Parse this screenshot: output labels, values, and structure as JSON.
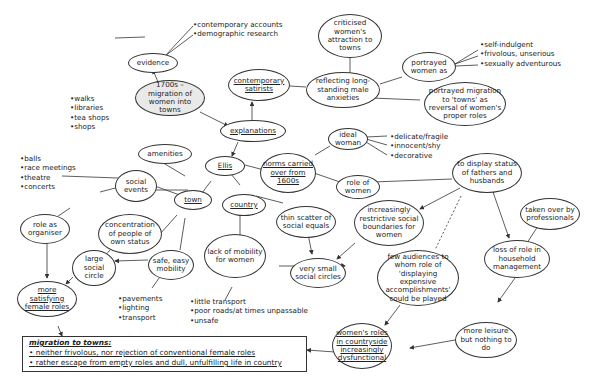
{
  "diagram": {
    "central": "1700s – migration of women into towns",
    "nodes": {
      "evidence": "evidence",
      "explanations": "explanations",
      "contemporary_satirists": "contemporary satirists",
      "criticised": "criticised women's attraction to towns",
      "reflecting": "reflecting long-standing male anxieties",
      "portrayed_women": "portrayed women as",
      "portrayed_migration": "portrayed migration to 'towns' as reversal of women's proper roles",
      "ellis": "Ellis",
      "norms": "norms carried over from 1600s",
      "ideal_woman": "ideal woman",
      "role_of_women": "role of women",
      "display_status": "to display status of fathers and husbands",
      "taken_over": "taken over by professionals",
      "loss_of_role": "loss of role in household management",
      "more_leisure": "more leisure but nothing to do",
      "restrictive": "increasingly restrictive social boundaries for women",
      "few_audiences": "few audiences to whom role of 'displaying expensive accomplishments' could be played",
      "womens_roles_country": "women's roles in countryside increasingly dysfunctional",
      "country": "country",
      "thin_scatter": "thin scatter of social equals",
      "lack_mobility": "lack of mobility for women",
      "very_small": "very small social circles",
      "town": "town",
      "amenities": "amenities",
      "social_events": "social events",
      "role_organiser": "role as organiser",
      "concentration": "concentration of people of own status",
      "large_circle": "large social circle",
      "safe_mobility": "safe, easy mobility",
      "more_satisfying": "more satisfying female roles"
    },
    "lists": {
      "evidence": [
        "contemporary accounts",
        "demographic research"
      ],
      "portrayed_women": [
        "self-indulgent",
        "frivolous, unserious",
        "sexually adventurous"
      ],
      "ideal_woman": [
        "delicate/fragile",
        "innocent/shy",
        "decorative"
      ],
      "amenities": [
        "walks",
        "libraries",
        "tea shops",
        "shops"
      ],
      "social_events": [
        "balls",
        "race meetings",
        "theatre",
        "concerts"
      ],
      "safe_mobility": [
        "pavements",
        "lighting",
        "transport"
      ],
      "lack_mobility": [
        "little transport",
        "poor roads/at times unpassable",
        "unsafe"
      ]
    },
    "summary": {
      "title": "migration to towns:",
      "bullets": [
        "neither frivolous, nor rejection of conventional female roles",
        "rather escape from empty roles and dull, unfulfilling life in country"
      ]
    },
    "colors": {
      "line": "#333333",
      "central_fill": "#e9e9e9",
      "background": "#ffffff"
    }
  }
}
